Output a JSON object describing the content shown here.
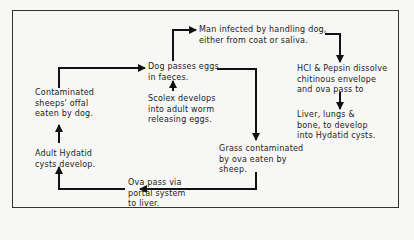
{
  "diagram": {
    "nodes": [
      {
        "id": "man",
        "text": "Man infected by handling dog,\neither from coat or saliva."
      },
      {
        "id": "dog_eggs",
        "text": "Dog passes eggs\nin faeces."
      },
      {
        "id": "hcl",
        "text": "HCl & Pepsin dissolve\nchitinous envelope\nand ova pass to"
      },
      {
        "id": "contaminated",
        "text": "Contaminated\nsheeps' offal\neaten by dog."
      },
      {
        "id": "scolex",
        "text": "Scolex develops\ninto adult worm\nreleasing eggs."
      },
      {
        "id": "liver",
        "text": "Liver, lungs &\nbone, to develop\ninto Hydatid cysts."
      },
      {
        "id": "adult_cysts",
        "text": "Adult Hydatid\ncysts develop."
      },
      {
        "id": "grass",
        "text": "Grass contaminated\nby ova eaten by\nsheep."
      },
      {
        "id": "ova_portal",
        "text": "Ova pass via\nportal system\nto liver."
      }
    ],
    "edges": [
      {
        "from": "dog_eggs",
        "to": "man"
      },
      {
        "from": "man",
        "to": "hcl"
      },
      {
        "from": "hcl",
        "to": "liver"
      },
      {
        "from": "dog_eggs",
        "to": "grass"
      },
      {
        "from": "grass",
        "to": "ova_portal"
      },
      {
        "from": "ova_portal",
        "to": "adult_cysts"
      },
      {
        "from": "adult_cysts",
        "to": "contaminated"
      },
      {
        "from": "contaminated",
        "to": "dog_eggs"
      },
      {
        "from": "scolex",
        "to": "dog_eggs"
      }
    ]
  }
}
